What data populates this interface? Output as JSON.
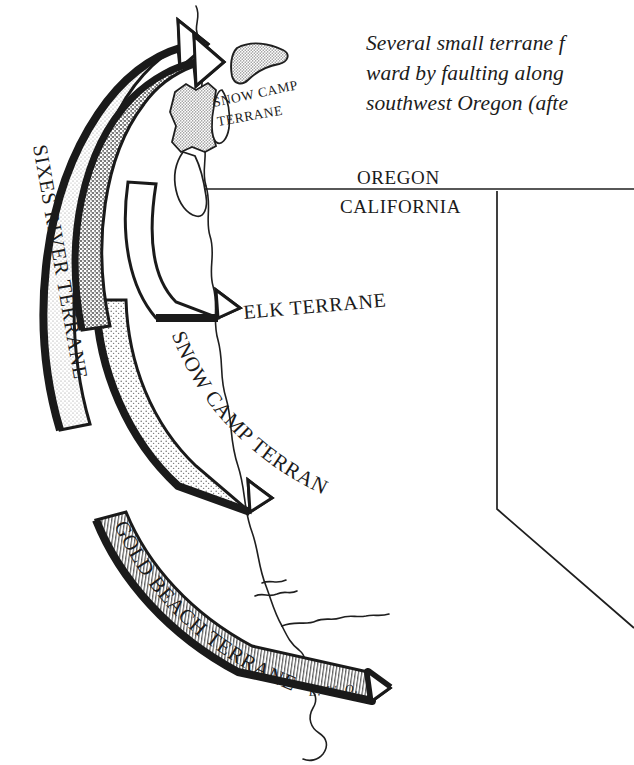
{
  "figure": {
    "background_color": "#ffffff",
    "ink_color": "#1a1a1a",
    "signature": "E. W. O."
  },
  "caption": {
    "line1": "Several small terrane f",
    "line2": "ward by faulting along",
    "line3": "southwest Oregon (afte",
    "clipped_right_edge": true
  },
  "map": {
    "state_labels": [
      {
        "name": "oregon",
        "text": "OREGON"
      },
      {
        "name": "california",
        "text": "CALIFORNIA"
      }
    ]
  },
  "terranes": [
    {
      "id": "sixes-river",
      "label": "SIXES RIVER TERRANE"
    },
    {
      "id": "snow-camp-inset",
      "label": "SNOW CAMP\nTERRANE",
      "line1": "SNOW CAMP",
      "line2": "TERRANE"
    },
    {
      "id": "elk",
      "label": "ELK TERRANE"
    },
    {
      "id": "snow-camp",
      "label": "SNOW CAMP TERRANE"
    },
    {
      "id": "gold-beach",
      "label": "GOLD BEACH TERRANE"
    }
  ],
  "arrows": [
    {
      "id": "arrow-sixes-river",
      "terrane": "SIXES RIVER TERRANE",
      "texture": "light-stipple",
      "direction": "counterclockwise-northeast"
    },
    {
      "id": "arrow-snow-camp",
      "terrane": "SNOW CAMP TERRANE",
      "texture": "coarse-stipple",
      "direction": "counterclockwise-northeast"
    },
    {
      "id": "arrow-elk",
      "terrane": "ELK TERRANE",
      "texture": "plain-white",
      "direction": "counterclockwise-northeast"
    },
    {
      "id": "arrow-gold-beach",
      "terrane": "GOLD BEACH TERRANE",
      "texture": "vertical-hatch",
      "direction": "counterclockwise-northeast"
    }
  ]
}
